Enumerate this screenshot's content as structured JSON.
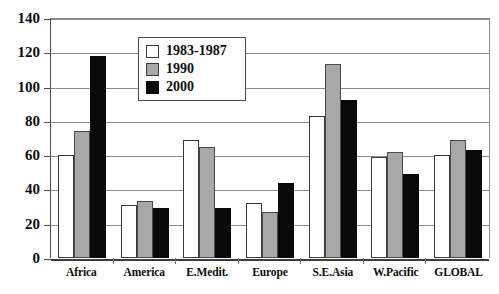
{
  "chart_data": {
    "type": "bar",
    "title": "",
    "subtitle": "",
    "xlabel": "",
    "ylabel": "",
    "ylim": [
      0,
      140
    ],
    "ytick_step": 20,
    "yticks": [
      140,
      120,
      100,
      80,
      60,
      40,
      20,
      0
    ],
    "grid": true,
    "legend_position": "top-center-inside",
    "categories": [
      "Africa",
      "America",
      "E.Medit.",
      "Europe",
      "S.E.Asia",
      "W.Pacific",
      "GLOBAL"
    ],
    "series": [
      {
        "name": "1983-1987",
        "color": "#ffffff",
        "values": [
          60,
          31,
          69,
          32,
          83,
          59,
          60
        ]
      },
      {
        "name": "1990",
        "color": "#a8a8a8",
        "values": [
          74,
          33,
          65,
          27,
          113,
          62,
          69
        ]
      },
      {
        "name": "2000",
        "color": "#0a0a0a",
        "values": [
          118,
          29,
          29,
          44,
          92,
          49,
          63
        ]
      }
    ]
  },
  "colors": {
    "series_1983_1987": "#ffffff",
    "series_1990": "#a8a8a8",
    "series_2000": "#0a0a0a",
    "axis": "#4d4d4d",
    "gridline": "#8c8c8c",
    "text": "#0d0d0d",
    "background": "#ffffff"
  }
}
